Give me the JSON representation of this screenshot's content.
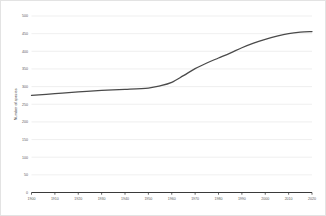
{
  "chart_data": {
    "type": "line",
    "title": "",
    "xlabel": "",
    "ylabel": "Number of species",
    "xlim": [
      1900,
      2020
    ],
    "ylim": [
      0,
      500
    ],
    "grid": true,
    "legend": "none",
    "x_ticks": [
      1900,
      1910,
      1920,
      1930,
      1940,
      1950,
      1960,
      1970,
      1980,
      1990,
      2000,
      2010,
      2020
    ],
    "y_ticks": [
      0,
      50,
      100,
      150,
      200,
      250,
      300,
      350,
      400,
      450,
      500
    ],
    "series": [
      {
        "name": "Number of species",
        "color": "#4a4a4a",
        "x": [
          1900,
          1910,
          1920,
          1930,
          1940,
          1950,
          1955,
          1960,
          1965,
          1970,
          1975,
          1980,
          1985,
          1990,
          1995,
          2000,
          2005,
          2010,
          2015,
          2020
        ],
        "values": [
          275,
          280,
          285,
          289,
          292,
          296,
          302,
          312,
          331,
          351,
          367,
          381,
          395,
          410,
          423,
          434,
          443,
          450,
          454,
          456
        ]
      }
    ]
  },
  "axes": {
    "y_title": "Number of species"
  }
}
